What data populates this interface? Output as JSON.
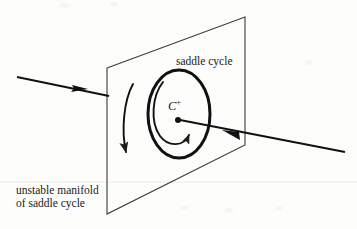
{
  "figure": {
    "type": "mathematical-phase-portrait-diagram",
    "background_color": "#fdfdfc",
    "ink_color": "#1b1b1b",
    "width": 357,
    "height": 229,
    "labels": {
      "saddle_cycle": "saddle cycle",
      "unstable_manifold_line1": "unstable manifold",
      "unstable_manifold_line2": "of saddle cycle",
      "equilibrium_point": "C",
      "equilibrium_point_superscript": "+"
    },
    "elements": {
      "plane": {
        "name": "cross-section-plane",
        "shape": "parallelogram",
        "points": "107,68 245,17 245,145 107,214"
      },
      "saddle_cycle_ellipse": {
        "name": "saddle-cycle-ellipse",
        "cx": 179,
        "cy": 114,
        "rx": 31,
        "ry": 44,
        "stroke_width": 3
      },
      "inner_spiral": {
        "name": "inward-spiral-trajectory",
        "stroke_width": 1.6,
        "arrowhead": "points-up-right-toward-center"
      },
      "center_dot": {
        "name": "saddle-cycle-point",
        "cx": 178,
        "cy": 120,
        "r": 3
      },
      "incoming_arrow_left": {
        "name": "incoming-manifold-arrow-left",
        "from": "17,77",
        "to": "108,96",
        "arrowhead_at": "82,89",
        "direction": "rightward"
      },
      "incoming_arrow_right": {
        "name": "incoming-manifold-arrow-right",
        "from": "345,152",
        "to": "179,120",
        "arrowhead_at": "228,134",
        "direction": "leftward"
      },
      "rotation_arrow": {
        "name": "rotation-direction-arrow",
        "direction": "downward-counterclockwise",
        "arrowhead_at": "126,162"
      }
    }
  }
}
